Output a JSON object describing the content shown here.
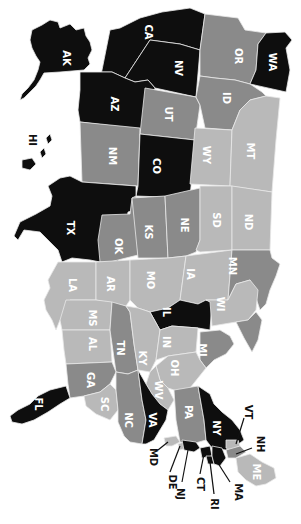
{
  "map": {
    "title": "United States choropleth (rotated 90° clockwise)",
    "orientation": "rotated-90-clockwise",
    "palette": {
      "black": "#0e0e0e",
      "dark": "#8a8a8a",
      "light": "#b9b9b9",
      "border": "#e8e8e8",
      "background": "#ffffff"
    },
    "states": [
      {
        "abbr": "AK",
        "shade": "black"
      },
      {
        "abbr": "HI",
        "shade": "black"
      },
      {
        "abbr": "CA",
        "shade": "black"
      },
      {
        "abbr": "NV",
        "shade": "black"
      },
      {
        "abbr": "OR",
        "shade": "dark"
      },
      {
        "abbr": "WA",
        "shade": "black"
      },
      {
        "abbr": "AZ",
        "shade": "black"
      },
      {
        "abbr": "UT",
        "shade": "dark"
      },
      {
        "abbr": "ID",
        "shade": "dark"
      },
      {
        "abbr": "NM",
        "shade": "dark"
      },
      {
        "abbr": "CO",
        "shade": "black"
      },
      {
        "abbr": "WY",
        "shade": "light"
      },
      {
        "abbr": "MT",
        "shade": "light"
      },
      {
        "abbr": "TX",
        "shade": "black"
      },
      {
        "abbr": "OK",
        "shade": "dark"
      },
      {
        "abbr": "KS",
        "shade": "dark"
      },
      {
        "abbr": "NE",
        "shade": "dark"
      },
      {
        "abbr": "SD",
        "shade": "light"
      },
      {
        "abbr": "ND",
        "shade": "light"
      },
      {
        "abbr": "LA",
        "shade": "light"
      },
      {
        "abbr": "AR",
        "shade": "light"
      },
      {
        "abbr": "MO",
        "shade": "light"
      },
      {
        "abbr": "IA",
        "shade": "light"
      },
      {
        "abbr": "MN",
        "shade": "dark"
      },
      {
        "abbr": "MS",
        "shade": "light"
      },
      {
        "abbr": "AL",
        "shade": "light"
      },
      {
        "abbr": "IL",
        "shade": "black"
      },
      {
        "abbr": "WI",
        "shade": "light"
      },
      {
        "abbr": "TN",
        "shade": "dark"
      },
      {
        "abbr": "KY",
        "shade": "light"
      },
      {
        "abbr": "IN",
        "shade": "light"
      },
      {
        "abbr": "MI",
        "shade": "dark"
      },
      {
        "abbr": "GA",
        "shade": "dark"
      },
      {
        "abbr": "OH",
        "shade": "light"
      },
      {
        "abbr": "FL",
        "shade": "black"
      },
      {
        "abbr": "SC",
        "shade": "light"
      },
      {
        "abbr": "WV",
        "shade": "light"
      },
      {
        "abbr": "NC",
        "shade": "dark"
      },
      {
        "abbr": "VA",
        "shade": "black"
      },
      {
        "abbr": "PA",
        "shade": "dark"
      },
      {
        "abbr": "NY",
        "shade": "black"
      },
      {
        "abbr": "MD",
        "shade": "light"
      },
      {
        "abbr": "DE",
        "shade": "light"
      },
      {
        "abbr": "NJ",
        "shade": "black"
      },
      {
        "abbr": "CT",
        "shade": "black"
      },
      {
        "abbr": "RI",
        "shade": "black"
      },
      {
        "abbr": "MA",
        "shade": "black"
      },
      {
        "abbr": "VT",
        "shade": "light"
      },
      {
        "abbr": "NH",
        "shade": "dark"
      },
      {
        "abbr": "ME",
        "shade": "light"
      }
    ],
    "labels": {
      "AK": "AK",
      "HI": "HI",
      "CA": "CA",
      "NV": "NV",
      "OR": "OR",
      "WA": "WA",
      "AZ": "AZ",
      "UT": "UT",
      "ID": "ID",
      "NM": "NM",
      "CO": "CO",
      "WY": "WY",
      "MT": "MT",
      "TX": "TX",
      "OK": "OK",
      "KS": "KS",
      "NE": "NE",
      "SD": "SD",
      "ND": "ND",
      "LA": "LA",
      "AR": "AR",
      "MO": "MO",
      "IA": "IA",
      "MN": "MN",
      "MS": "MS",
      "AL": "AL",
      "IL": "IL",
      "WI": "WI",
      "TN": "TN",
      "KY": "KY",
      "IN": "IN",
      "MI": "MI",
      "GA": "GA",
      "OH": "OH",
      "FL": "FL",
      "SC": "SC",
      "WV": "WV",
      "NC": "NC",
      "VA": "VA",
      "PA": "PA",
      "NY": "NY",
      "MD": "MD",
      "DE": "DE",
      "NJ": "NJ",
      "CT": "CT",
      "RI": "RI",
      "MA": "MA",
      "VT": "VT",
      "NH": "NH",
      "ME": "ME"
    }
  }
}
